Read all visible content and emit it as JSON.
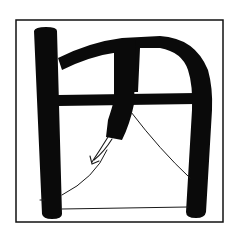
{
  "illustration": {
    "description": "Ink brush drawing of a stylized character inside a square frame",
    "background": "#ffffff",
    "ink_color": "#0a0a0a",
    "line_color": "#1a1a1a",
    "frame": {
      "x": 16,
      "y": 20,
      "width": 207,
      "height": 202,
      "stroke_width": 1.5
    },
    "strokes": {
      "left_bar": "M34 31 Q35 27 46 27 Q57 27 57 31 L62 214 Q62 219 52 219 Q43 219 42 214 Z",
      "top_arch": "M58 58 Q90 42 122 38 L160 36 Q195 38 208 70 Q213 88 212 110 L206 212 Q205 218 196 218 Q186 218 186 212 L192 110 Q193 85 188 70 Q182 52 160 48 L140 48 L138 92 L119 92 L119 52 Q90 56 62 70 Z",
      "crossbar": "M58 95 L196 93 L196 104 L58 106 Z",
      "center_stroke": "M114 40 L136 40 L134 104 Q130 124 122 140 L106 137 L108 120 Q112 108 114 100 Z",
      "left_inner_notch": "M56 105 Q58 110 62 108 L62 96 Z"
    },
    "lines": {
      "arrow_long": {
        "d": "M108 137 Q100 150 92 162",
        "width": 1.1
      },
      "arrow_short": {
        "d": "M112 139 Q104 152 94 160",
        "width": 1.1
      },
      "arrow_head": {
        "d": "M90 156 L92 164 L99 161",
        "width": 1.1
      },
      "left_curve": {
        "d": "M62 195 Q95 178 107 150",
        "width": 1.0
      },
      "right_slope": {
        "d": "M131 112 Q160 150 190 178",
        "width": 1.0
      },
      "base_line": {
        "d": "M62 209 L188 207",
        "width": 1.0
      },
      "left_tick": {
        "d": "M40 200 L44 200",
        "width": 1.0
      }
    }
  }
}
